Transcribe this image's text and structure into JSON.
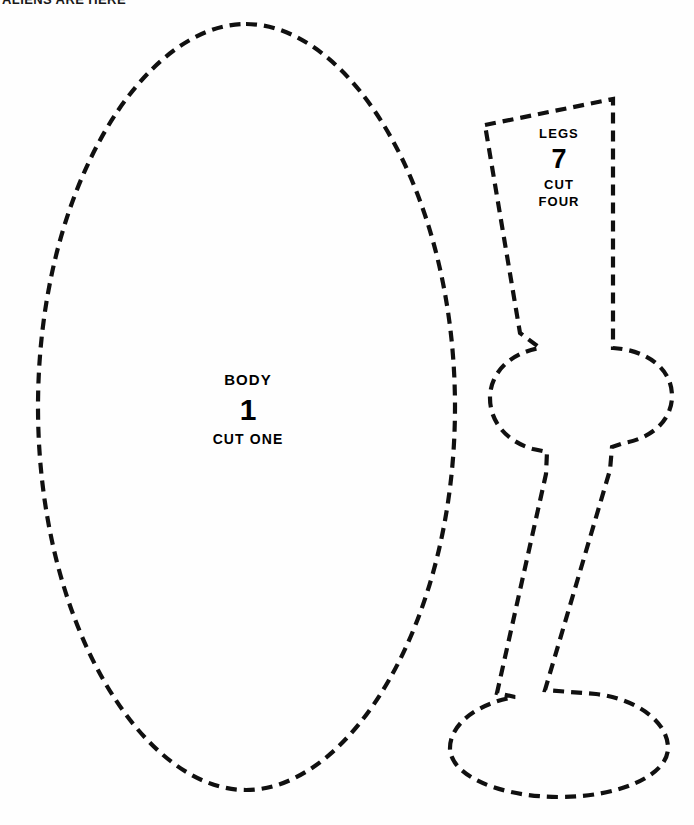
{
  "header": {
    "text": "ALIENS ARE HERE"
  },
  "page": {
    "width": 694,
    "height": 825,
    "background_color": "#fefefe",
    "line_color": "#101010"
  },
  "pattern": {
    "title": "Cut-out sewing pattern sheet",
    "pieces": [
      {
        "id": "body",
        "name": "BODY",
        "number": "1",
        "cut_instruction": "CUT ONE",
        "shape": "oval",
        "bounds": {
          "x": 38,
          "y": 24,
          "width": 417,
          "height": 766
        }
      },
      {
        "id": "legs",
        "name": "LEGS",
        "number": "7",
        "cut_instruction": "CUT",
        "cut_instruction_second": "FOUR",
        "shape": "leg-with-foot",
        "bounds": {
          "x": 448,
          "y": 98,
          "width": 226,
          "height": 700
        }
      }
    ]
  },
  "geometry": {
    "body_outline": "M 246 24 C 349 24 455 190 455 407 C 455 624 349 790 246 790 C 143 790 38 624 38 407 C 38 190 143 24 246 24 Z",
    "legs_outline": "M 485 125 L 613 99 L 613 348 C 646 350 672 368 672 396 C 672 420 652 438 624 443 L 612 447 L 610 470 L 545 690 L 596 694 C 637 699 668 722 668 748 C 668 775 620 797 560 797 C 498 797 450 775 450 748 C 450 724 478 703 515 697 L 497 693 L 546 474 L 547 452 L 533 449 C 508 442 490 423 490 398 C 490 373 510 353 540 348 L 520 333 Z"
  }
}
